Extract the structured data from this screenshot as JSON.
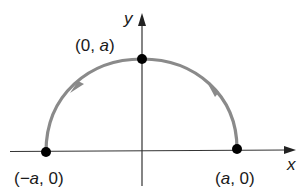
{
  "diagram": {
    "type": "semicircle-parametric-path",
    "axes": {
      "x_label": "x",
      "y_label": "y"
    },
    "points": [
      {
        "id": "left",
        "label_open": "(",
        "label_var": "−a",
        "label_rest": ", 0)"
      },
      {
        "id": "top",
        "label_open": "(",
        "label_num": "0, ",
        "label_var": "a",
        "label_close": ")"
      },
      {
        "id": "right",
        "label_open": "(",
        "label_var": "a",
        "label_rest": ", 0)"
      }
    ],
    "curve": {
      "description": "Upper semicircle of radius a traced counterclockwise from (a, 0) to (-a, 0)",
      "direction": "counterclockwise",
      "color": "#8a8a8a"
    },
    "colors": {
      "axis": "#333333",
      "point": "#000000",
      "curve": "#8a8a8a"
    }
  }
}
